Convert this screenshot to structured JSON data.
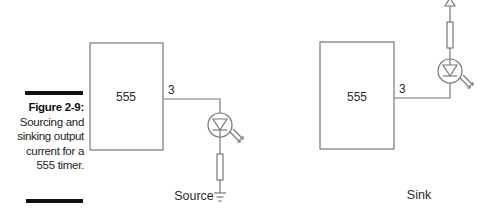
{
  "figure": {
    "label": "Figure 2-9:",
    "caption": "Sourcing and sinking output current for a 555 timer."
  },
  "source_circuit": {
    "chip_label": "555",
    "pin_label": "3",
    "title": "Source",
    "components": [
      "555 chip",
      "pin 3 output wire",
      "LED",
      "resistor",
      "ground"
    ]
  },
  "sink_circuit": {
    "chip_label": "555",
    "pin_label": "3",
    "title": "Sink",
    "components": [
      "555 chip",
      "pin 3 output wire",
      "LED",
      "resistor",
      "supply (+V) arrow"
    ]
  },
  "colors": {
    "line": "#777777",
    "text": "#2a2a2a",
    "bar": "#111111"
  }
}
